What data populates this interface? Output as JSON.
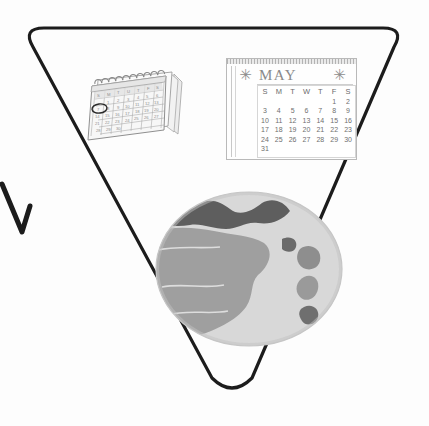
{
  "image": {
    "kind": "scanned-line-illustration",
    "background_color": "#fdfdfd",
    "ink_color": "#1a1a1a"
  },
  "triangle": {
    "name": "inverted-triangle-outline",
    "stroke_color": "#1c1c1c",
    "stroke_width_px": 3,
    "corner_radius_px": 22,
    "vertices": [
      [
        22,
        28
      ],
      [
        405,
        28
      ],
      [
        232,
        390
      ]
    ]
  },
  "stray_mark": {
    "name": "partial-y-stroke",
    "stroke_color": "#1c1c1c",
    "stroke_width_px": 5
  },
  "desk_calendar": {
    "title": "spiral desk calendar",
    "weekday_headers": [
      "S",
      "M",
      "T",
      "U",
      "T",
      "F",
      "S"
    ],
    "rings_count": 11,
    "circled_day": "7",
    "rows": [
      [
        "",
        "1",
        "2",
        "3",
        "4",
        "5",
        "6"
      ],
      [
        "7",
        "8",
        "9",
        "10",
        "11",
        "12",
        "13"
      ],
      [
        "14",
        "15",
        "16",
        "17",
        "18",
        "19",
        "20"
      ],
      [
        "21",
        "22",
        "23",
        "24",
        "25",
        "26",
        "27"
      ],
      [
        "28",
        "29",
        "30",
        "",
        "",
        "",
        ""
      ]
    ],
    "colors": {
      "paper": "#f6f6f6",
      "line": "#9a9a9a",
      "ring": "#8f8f8f",
      "circle_highlight": "#2a2a2a"
    }
  },
  "wall_calendar": {
    "month": "MAY",
    "decoration_left": "star-burst",
    "decoration_right": "star-burst",
    "weekday_headers": [
      "S",
      "M",
      "T",
      "W",
      "T",
      "F",
      "S"
    ],
    "weeks": [
      [
        "",
        "",
        "",
        "",
        "",
        "1",
        "2"
      ],
      [
        "3",
        "4",
        "5",
        "6",
        "7",
        "8",
        "9"
      ],
      [
        "10",
        "11",
        "12",
        "13",
        "14",
        "15",
        "16"
      ],
      [
        "17",
        "18",
        "19",
        "20",
        "21",
        "22",
        "23"
      ],
      [
        "24",
        "25",
        "26",
        "27",
        "28",
        "29",
        "30"
      ],
      [
        "31",
        "",
        "",
        "",
        "",
        "",
        ""
      ]
    ],
    "colors": {
      "paper": "#fefefe",
      "border": "#b9b9b9",
      "text": "#6f6f6f",
      "title": "#8a8a8a"
    }
  },
  "globe": {
    "name": "earth-globe",
    "style": "grayscale halftone",
    "colors": {
      "ocean": "#d3d3d3",
      "land": "#9a9a9a",
      "mountain": "#5e5e5e",
      "edge": "#c2c2c2"
    },
    "features": [
      "northern mountain range",
      "large western landmass",
      "eastern islands"
    ]
  }
}
